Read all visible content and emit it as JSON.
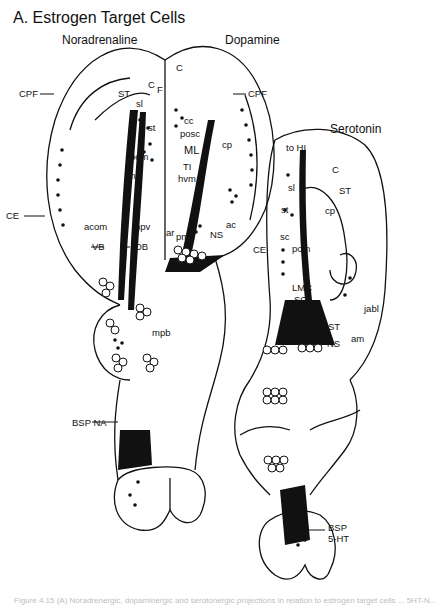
{
  "figure": {
    "title": "A. Estrogen Target Cells",
    "caption_fragment": "Figure 4.15  (A) Noradrenergic, dopaminergic and serotonergic projections in relation to estrogen target cells ... 5HT-N..."
  },
  "systems": {
    "noradrenaline": "Noradrenaline",
    "dopamine": "Dopamine",
    "serotonin": "Serotonin"
  },
  "labels": {
    "noradrenaline": {
      "cpf": "CPF",
      "st": "ST",
      "c": "C",
      "f": "F",
      "sl": "sl",
      "st_small": "st",
      "pom": "pom",
      "fm": "fm",
      "ce": "CE",
      "acom": "acom",
      "hpv": "hpv",
      "vb": "VB",
      "db": "DB",
      "mpb": "mpb",
      "bsp_na": "BSP NA"
    },
    "dopamine": {
      "c": "C",
      "cpf": "CPF",
      "cc": "cc",
      "posc": "posc",
      "ml": "ML",
      "cp": "cp",
      "ti": "TI",
      "hvm": "hvm",
      "ar": "ar",
      "pm": "pm",
      "ns": "NS",
      "ac": "ac",
      "ce": "CE"
    },
    "serotonin": {
      "to_hi": "to HI",
      "c": "C",
      "st": "ST",
      "sl": "sl",
      "st_small": "st",
      "sc": "sc",
      "cp": "cp",
      "pom": "pom",
      "lmc": "LMC",
      "so": "SO",
      "jabl": "jabl",
      "fr": "FR",
      "st2": "ST",
      "am": "am",
      "ns": "NS",
      "bsp": "BSP",
      "five_ht": "5-HT"
    }
  }
}
